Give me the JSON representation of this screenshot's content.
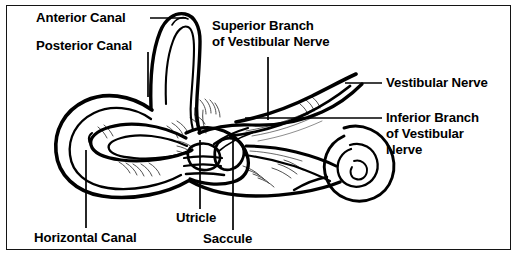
{
  "figure": {
    "border_color": "#141414",
    "background_color": "#ffffff",
    "ink_color": "#000000",
    "width": 519,
    "height": 257
  },
  "labels": {
    "anterior_canal": "Anterior Canal",
    "posterior_canal": "Posterior Canal",
    "superior_branch_line1": "Superior Branch",
    "superior_branch_line2": "of Vestibular Nerve",
    "vestibular_nerve": "Vestibular Nerve",
    "inferior_branch_line1": "Inferior Branch",
    "inferior_branch_line2": "of Vestibular",
    "inferior_branch_line3": "Nerve",
    "horizontal_canal": "Horizontal Canal",
    "utricle": "Utricle",
    "saccule": "Saccule"
  }
}
